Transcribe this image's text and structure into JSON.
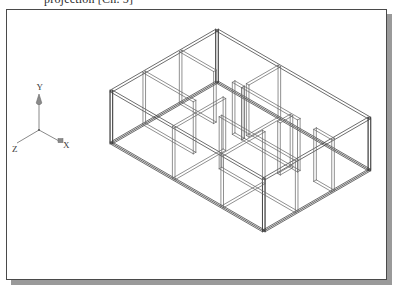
{
  "caption": {
    "text": "projection [Ch. 5]"
  },
  "figure": {
    "frame_border_color": "#4a4a4a",
    "shadow_color": "#9a9a9a",
    "background_color": "#ffffff",
    "line_color": "#6b6b6b",
    "line_color_dark": "#3c3c3c"
  },
  "axis_indicator": {
    "name": "ucs-axis-tripod",
    "origin_label": "",
    "axes": [
      {
        "name": "y-axis",
        "label": "Y",
        "direction": "up"
      },
      {
        "name": "z-axis",
        "label": "Z",
        "direction": "lower-left"
      },
      {
        "name": "x-axis",
        "label": "X",
        "direction": "lower-right"
      }
    ]
  },
  "model": {
    "type": "isometric-wireframe",
    "description": "Floor plan extruded to wall height, drawn as double-line wall faces in isometric projection",
    "room_count": 6,
    "wall_thickness_px": 3,
    "wall_height_px": 52
  },
  "geometry": {
    "note": "All coordinates are plan-space (px) in the figure frame; projected isometrically.",
    "iso": {
      "ux": 0.866,
      "uy": 0.5,
      "vx": -0.866,
      "vy": 0.5,
      "origin_x": 210,
      "origin_y": 72,
      "scale": 1.0,
      "wall_height": 52
    },
    "outline": [
      [
        0,
        0
      ],
      [
        176,
        0
      ],
      [
        176,
        122
      ],
      [
        0,
        122
      ]
    ],
    "interior_walls": [
      {
        "name": "wall-n-spine",
        "a": [
          0,
          42
        ],
        "b": [
          72,
          42
        ]
      },
      {
        "name": "wall-mid-spine",
        "a": [
          72,
          0
        ],
        "b": [
          72,
          122
        ]
      },
      {
        "name": "wall-e-upper",
        "a": [
          72,
          42
        ],
        "b": [
          176,
          42
        ]
      },
      {
        "name": "wall-mid-cross",
        "a": [
          0,
          84
        ],
        "b": [
          176,
          84
        ]
      },
      {
        "name": "wall-e-vert",
        "a": [
          128,
          42
        ],
        "b": [
          128,
          122
        ]
      }
    ],
    "openings": [
      {
        "name": "door-1",
        "wall": "wall-n-spine",
        "t0": 0.55,
        "t1": 0.85
      },
      {
        "name": "door-2",
        "wall": "wall-mid-spine",
        "t0": 0.3,
        "t1": 0.52
      },
      {
        "name": "door-3",
        "wall": "wall-mid-cross",
        "t0": 0.33,
        "t1": 0.5
      },
      {
        "name": "door-4",
        "wall": "wall-e-vert",
        "t0": 0.18,
        "t1": 0.4
      },
      {
        "name": "door-5",
        "wall": "wall-e-upper",
        "t0": 0.62,
        "t1": 0.8
      }
    ]
  }
}
